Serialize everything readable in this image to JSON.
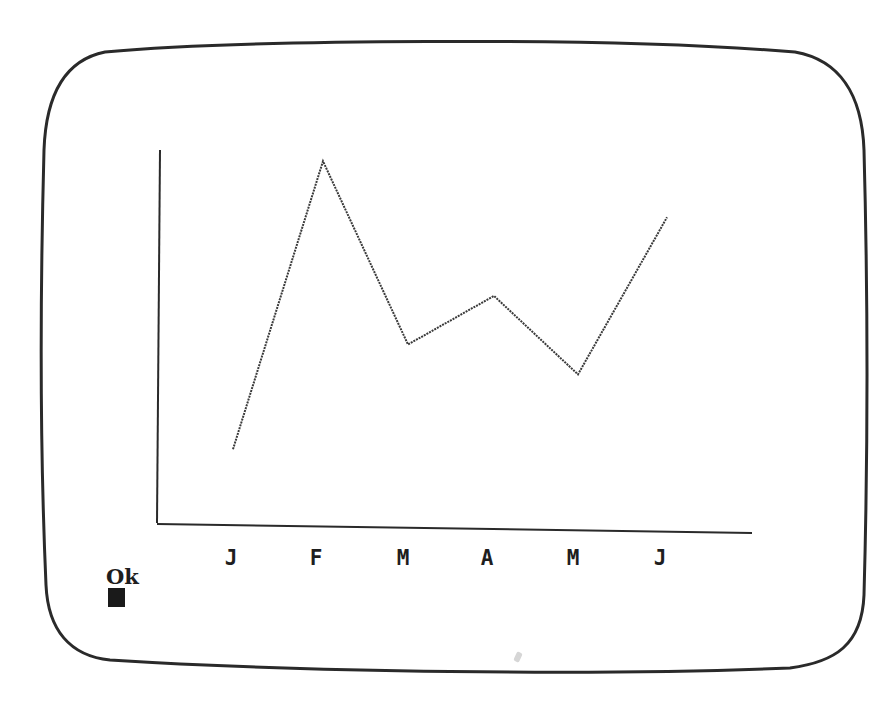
{
  "screen": {
    "prompt": "Ok",
    "cursor": "block-cursor",
    "colors": {
      "background": "#ffffff",
      "ink": "#1e1e1e",
      "bezel": "#2a2a2a"
    }
  },
  "labels": [
    "J",
    "F",
    "M",
    "A",
    "M",
    "J"
  ],
  "chart_data": {
    "type": "line",
    "title": "",
    "xlabel": "",
    "ylabel": "",
    "categories": [
      "J",
      "F",
      "M",
      "A",
      "M",
      "J"
    ],
    "values": [
      20,
      97,
      48,
      61,
      40,
      82
    ],
    "ylim": [
      0,
      100
    ],
    "grid": false,
    "legend": null,
    "y_ticks_shown": false
  }
}
